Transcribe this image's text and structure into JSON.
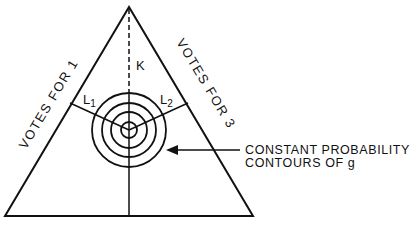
{
  "diagram": {
    "labels": {
      "votes_for_1": "VOTES FOR 1",
      "votes_for_3": "VOTES FOR 3",
      "k": "K",
      "l1_main": "L",
      "l1_sub": "1",
      "l2_main": "L",
      "l2_sub": "2",
      "contour_line1": "CONSTANT PROBABILITY",
      "contour_line2": "CONTOURS OF g"
    },
    "colors": {
      "stroke": "#111111",
      "background": "#ffffff"
    }
  }
}
